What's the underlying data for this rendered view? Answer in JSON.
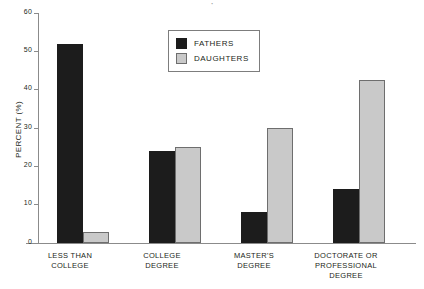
{
  "title_remnant": "·",
  "chart_data": {
    "type": "bar",
    "title": "",
    "xlabel": "",
    "ylabel": "PERCENT (%)",
    "ylim": [
      0,
      60
    ],
    "yticks": [
      0,
      10,
      20,
      30,
      40,
      50,
      60
    ],
    "ytick_labels": [
      "0",
      "10",
      "20",
      "30",
      "40",
      "50",
      "60"
    ],
    "grid": false,
    "legend_position": "top-center",
    "categories": [
      "LESS THAN\nCOLLEGE",
      "COLLEGE\nDEGREE",
      "MASTER'S\nDEGREE",
      "DOCTORATE OR\nPROFESSIONAL\nDEGREE"
    ],
    "category_lines": [
      [
        "LESS THAN",
        "COLLEGE"
      ],
      [
        "COLLEGE",
        "DEGREE"
      ],
      [
        "MASTER'S",
        "DEGREE"
      ],
      [
        "DOCTORATE OR",
        "PROFESSIONAL",
        "DEGREE"
      ]
    ],
    "series": [
      {
        "name": "FATHERS",
        "color": "#1c1c1c",
        "values": [
          52,
          24,
          8,
          14
        ]
      },
      {
        "name": "DAUGHTERS",
        "color": "#c9c9c9",
        "values": [
          3,
          25,
          30,
          42.5
        ]
      }
    ]
  },
  "legend": {
    "items": [
      {
        "label": "FATHERS",
        "swatch": "fathers-swatch"
      },
      {
        "label": "DAUGHTERS",
        "swatch": "daughters-swatch"
      }
    ]
  },
  "axis": {
    "y_title": "PERCENT (%)",
    "tick_0": "0",
    "tick_10": "10",
    "tick_20": "20",
    "tick_30": "30",
    "tick_40": "40",
    "tick_50": "50",
    "tick_60": "60"
  },
  "x_labels": {
    "cat0_line0": "LESS THAN",
    "cat0_line1": "COLLEGE",
    "cat1_line0": "COLLEGE",
    "cat1_line1": "DEGREE",
    "cat2_line0": "MASTER'S",
    "cat2_line1": "DEGREE",
    "cat3_line0": "DOCTORATE OR",
    "cat3_line1": "PROFESSIONAL",
    "cat3_line2": "DEGREE"
  }
}
